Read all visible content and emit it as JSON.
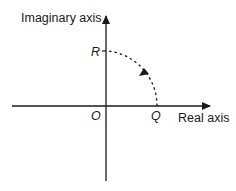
{
  "diagram": {
    "type": "complex-plane",
    "axes": {
      "vertical_label": "Imaginary axis",
      "horizontal_label": "Real axis"
    },
    "points": {
      "origin": "O",
      "real_point": "Q",
      "imaginary_point": "R"
    },
    "arc": {
      "from": "Q",
      "to": "R",
      "style": "dashed",
      "direction": "counterclockwise"
    },
    "colors": {
      "line": "#1a1a1a",
      "background": "#ffffff"
    }
  }
}
